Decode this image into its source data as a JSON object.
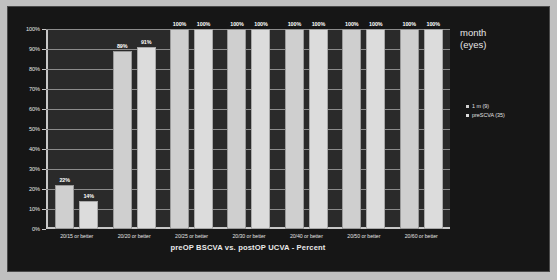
{
  "chart_data": {
    "type": "bar",
    "title": "",
    "xlabel": "preOP BSCVA vs. postOP UCVA - Percent",
    "ylabel": "",
    "ylim": [
      0,
      100
    ],
    "grid": true,
    "legend_position": "right",
    "categories": [
      "20/15 or better",
      "20/20 or better",
      "20/25 or better",
      "20/30 or better",
      "20/40 or better",
      "20/50 or better",
      "20/60 or better"
    ],
    "yticks": [
      "0%",
      "10%",
      "20%",
      "30%",
      "40%",
      "50%",
      "60%",
      "70%",
      "80%",
      "90%",
      "100%"
    ],
    "ytick_values": [
      0,
      10,
      20,
      30,
      40,
      50,
      60,
      70,
      80,
      90,
      100
    ],
    "legend_title_line1": "month",
    "legend_title_line2": "(eyes)",
    "series": [
      {
        "name": "1 m (9)",
        "color": "#cfcfcf",
        "values": [
          22,
          89,
          100,
          100,
          100,
          100,
          100
        ],
        "labels": [
          "22%",
          "89%",
          "100%",
          "100%",
          "100%",
          "100%",
          "100%"
        ]
      },
      {
        "name": "preSCVA (35)",
        "color": "#dcdcdc",
        "values": [
          14,
          91,
          100,
          100,
          100,
          100,
          100
        ],
        "labels": [
          "14%",
          "91%",
          "100%",
          "100%",
          "100%",
          "100%",
          "100%"
        ]
      }
    ]
  },
  "colors": {
    "panel_background": "#161616",
    "plot_background": "#2a2a2a",
    "axis": "#c8c8c8",
    "gridline": "#8c8c8c",
    "text": "#e8e8e8"
  }
}
